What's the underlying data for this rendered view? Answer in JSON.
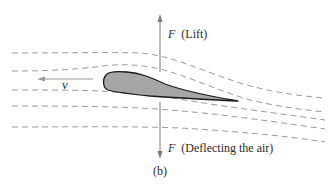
{
  "figure": {
    "panel_label": "(b)",
    "velocity_label": "v",
    "lift_force": {
      "symbol": "F",
      "description": "(Lift)"
    },
    "deflect_force": {
      "symbol": "F",
      "description": "(Deflecting the air)"
    }
  },
  "colors": {
    "airfoil_fill": "#a6a6a6",
    "airfoil_outline": "#1a1a1a",
    "streamline": "#9a9a9a",
    "force_arrow": "#7a7a7a",
    "velocity_arrow": "#9a9a9a",
    "text": "#2a2a2a"
  }
}
